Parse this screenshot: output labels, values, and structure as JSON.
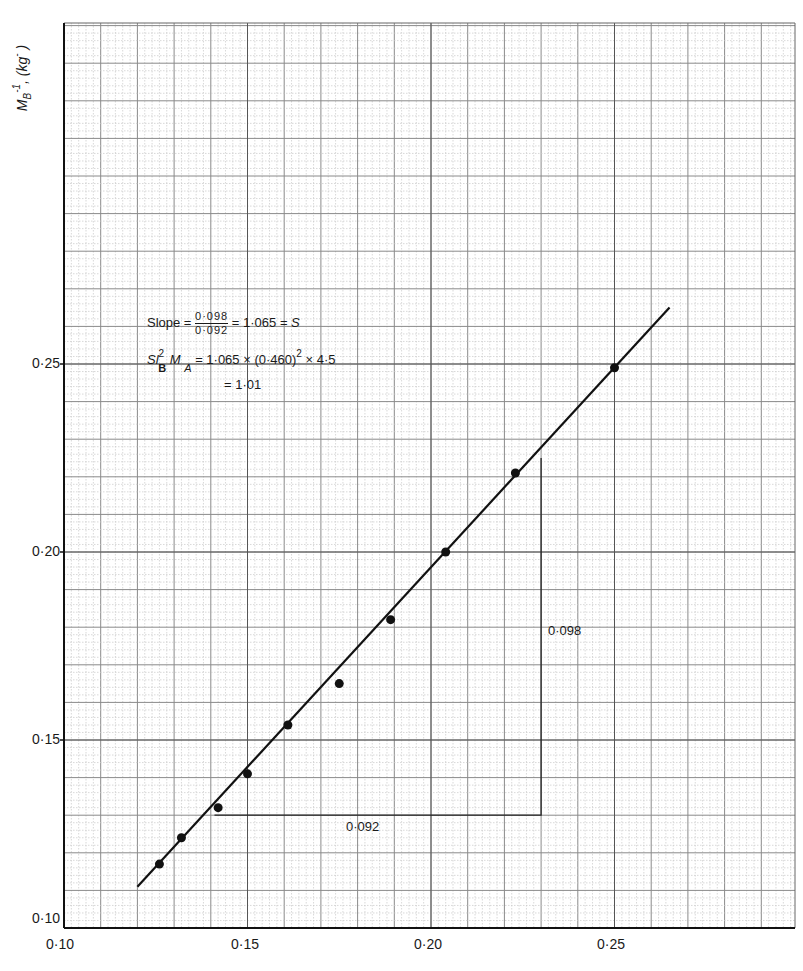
{
  "chart_data": {
    "type": "scatter",
    "title": "",
    "xlabel": "",
    "ylabel": "M_B^-1 , (kg^- )",
    "xlim": [
      0.1,
      0.3
    ],
    "ylim": [
      0.1,
      0.335
    ],
    "grid": true,
    "x_ticks": [
      "0·10",
      "0·15",
      "0·20",
      "0·25"
    ],
    "y_ticks": [
      "0·10",
      "0·15",
      "0·20",
      "0·25"
    ],
    "series": [
      {
        "name": "data points",
        "type": "scatter",
        "x": [
          0.126,
          0.132,
          0.142,
          0.15,
          0.161,
          0.175,
          0.189,
          0.204,
          0.223,
          0.25
        ],
        "y": [
          0.117,
          0.124,
          0.132,
          0.141,
          0.154,
          0.165,
          0.182,
          0.2,
          0.221,
          0.249
        ]
      },
      {
        "name": "fitted line",
        "type": "line",
        "x": [
          0.12,
          0.265
        ],
        "y": [
          0.111,
          0.265
        ]
      }
    ],
    "slope_triangle": {
      "x0": 0.141,
      "x1": 0.23,
      "y_base": 0.13,
      "y_top": 0.225,
      "dx_label": "0·092",
      "dy_label": "0·098"
    },
    "annotations": {
      "slope_prefix": "Slope = ",
      "slope_num": "0·098",
      "slope_den": "0·092",
      "slope_result": " = 1·065 = ",
      "slope_symbol": "S",
      "eq2_left_S": "S",
      "eq2_left_l": "l",
      "eq2_sup": "2",
      "eq2_sub_B": "B",
      "eq2_M": "M",
      "eq2_sub_A": "A",
      "eq2_right": " = 1·065 × (0·460)",
      "eq2_right_sup": "2",
      "eq2_right_tail": " × 4·5",
      "eq3": "= 1·01"
    }
  },
  "axis_label": {
    "y_main": "M",
    "y_sub": "B",
    "y_sup": "-1",
    "y_unit": ", (kg",
    "y_unit_sup": "-",
    "y_close": " )"
  }
}
